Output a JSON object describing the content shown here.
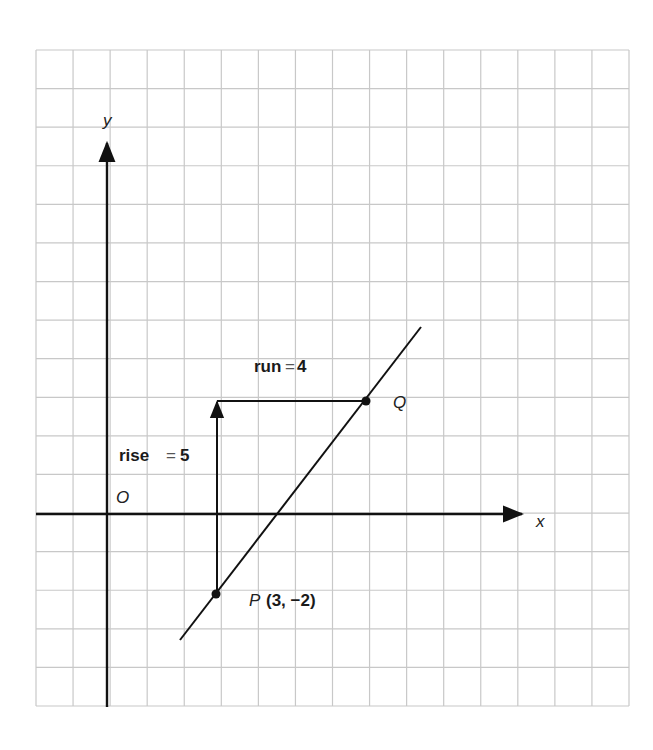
{
  "figure": {
    "type": "coordinate-plane",
    "grid": {
      "columns": 16,
      "rows": 17,
      "left": 36,
      "top": 50,
      "right": 629,
      "bottom": 706,
      "color": "#c8c8c8"
    },
    "origin_px": {
      "x": 107,
      "y": 514
    },
    "unit_px": {
      "x": 36.3,
      "y": 38.6
    },
    "axes": {
      "x_label": "x",
      "y_label": "y",
      "origin_label": "O"
    },
    "points": [
      {
        "name": "P",
        "label": "P",
        "coords_label": "(3, −2)",
        "x": 3,
        "y": -2
      },
      {
        "name": "Q",
        "label": "Q",
        "coords_label": "",
        "x": 7,
        "y": 3
      }
    ],
    "line": {
      "from": {
        "x": 2,
        "y": -3.2
      },
      "to": {
        "x": 8.65,
        "y": 4.95
      }
    },
    "annotations": {
      "run_word": "run",
      "run_eq": "=",
      "run_value": "4",
      "rise_word": "rise",
      "rise_eq": "=",
      "rise_value": "5"
    },
    "colors": {
      "ink": "#111111",
      "grid": "#c8c8c8",
      "background": "#ffffff"
    }
  }
}
